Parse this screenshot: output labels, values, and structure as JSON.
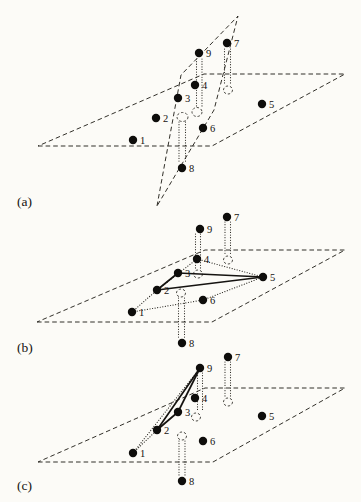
{
  "style": {
    "background": "#fcfbf7",
    "ink": "#27251f",
    "dot_color": "#0e0d0b"
  },
  "figure": {
    "subfigures": [
      {
        "key": "a",
        "label": "(a)",
        "label_x": 17,
        "label_y": 206,
        "planes": [
          {
            "name": "base-plane",
            "vertices": [
              [
                38,
                146
              ],
              [
                212,
                146
              ],
              [
                345,
                74
              ],
              [
                204,
                74
              ]
            ]
          },
          {
            "name": "transversal-plane",
            "vertices": [
              [
                157,
                206
              ],
              [
                181,
                75
              ],
              [
                238,
                16
              ],
              [
                214,
                110
              ]
            ]
          }
        ],
        "points": [
          {
            "id": "1",
            "x": 133,
            "y": 140
          },
          {
            "id": "2",
            "x": 156,
            "y": 118
          },
          {
            "id": "3",
            "x": 178,
            "y": 98
          },
          {
            "id": "4",
            "x": 195,
            "y": 85
          },
          {
            "id": "5",
            "x": 262,
            "y": 104
          },
          {
            "id": "6",
            "x": 203,
            "y": 128
          },
          {
            "id": "7",
            "x": 227,
            "y": 43
          },
          {
            "id": "8",
            "x": 182,
            "y": 168
          },
          {
            "id": "9",
            "x": 199,
            "y": 53
          }
        ],
        "solid_edges": [],
        "dotted_edges": [],
        "projections": [
          {
            "of": "9",
            "lines": [
              [
                196.5,
                59,
                196.5,
                107
              ],
              [
                202,
                59,
                202,
                107
              ]
            ],
            "ellipse": [
              197,
              112,
              5,
              4.5
            ]
          },
          {
            "of": "7",
            "lines": [
              [
                224.5,
                49,
                224.5,
                85
              ],
              [
                230.5,
                49,
                230.5,
                85
              ]
            ],
            "ellipse": [
              228,
              90,
              4.5,
              4
            ]
          },
          {
            "of": "8",
            "lines": [
              [
                179,
                122,
                179,
                163
              ],
              [
                185.5,
                122,
                185.5,
                163
              ]
            ],
            "ellipse": [
              182.5,
              117,
              5.5,
              4.5
            ]
          }
        ]
      },
      {
        "key": "b",
        "label": "(b)",
        "label_x": 17,
        "label_y": 352,
        "planes": [
          {
            "name": "base-plane",
            "vertices": [
              [
                37,
                322
              ],
              [
                212,
                322
              ],
              [
                345,
                250
              ],
              [
                205,
                250
              ]
            ]
          }
        ],
        "points": [
          {
            "id": "1",
            "x": 132,
            "y": 312
          },
          {
            "id": "2",
            "x": 157,
            "y": 290
          },
          {
            "id": "3",
            "x": 178,
            "y": 273
          },
          {
            "id": "4",
            "x": 197,
            "y": 259
          },
          {
            "id": "5",
            "x": 263,
            "y": 277
          },
          {
            "id": "6",
            "x": 203,
            "y": 300
          },
          {
            "id": "7",
            "x": 227,
            "y": 217
          },
          {
            "id": "8",
            "x": 182,
            "y": 343
          },
          {
            "id": "9",
            "x": 200,
            "y": 229
          }
        ],
        "solid_edges": [
          [
            "2",
            "3"
          ],
          [
            "3",
            "5"
          ],
          [
            "2",
            "5"
          ]
        ],
        "dotted_edges": [
          [
            "1",
            "2"
          ],
          [
            "2",
            "4"
          ],
          [
            "4",
            "5"
          ],
          [
            "1",
            "6"
          ],
          [
            "6",
            "5"
          ]
        ],
        "projections": [
          {
            "of": "9",
            "lines": [
              [
                195.5,
                234,
                195.5,
                269
              ],
              [
                200.5,
                234,
                200.5,
                269
              ]
            ],
            "ellipse": [
              198,
              274,
              4.5,
              4
            ]
          },
          {
            "of": "7",
            "lines": [
              [
                225,
                222,
                225,
                255
              ],
              [
                230.5,
                222,
                230.5,
                255
              ]
            ],
            "ellipse": [
              228,
              260,
              4.5,
              4
            ]
          },
          {
            "of": "8",
            "lines": [
              [
                178.5,
                298,
                178.5,
                338
              ],
              [
                184.5,
                298,
                184.5,
                338
              ]
            ],
            "ellipse": [
              181,
              293,
              4.5,
              4
            ]
          }
        ]
      },
      {
        "key": "c",
        "label": "(c)",
        "label_x": 17,
        "label_y": 490,
        "planes": [
          {
            "name": "base-plane",
            "vertices": [
              [
                38,
                462
              ],
              [
                213,
                462
              ],
              [
                345,
                388
              ],
              [
                205,
                388
              ]
            ]
          }
        ],
        "points": [
          {
            "id": "1",
            "x": 133,
            "y": 453
          },
          {
            "id": "2",
            "x": 157,
            "y": 430
          },
          {
            "id": "3",
            "x": 178,
            "y": 412
          },
          {
            "id": "4",
            "x": 195,
            "y": 398
          },
          {
            "id": "5",
            "x": 262,
            "y": 416
          },
          {
            "id": "6",
            "x": 203,
            "y": 441
          },
          {
            "id": "7",
            "x": 228,
            "y": 357
          },
          {
            "id": "8",
            "x": 182,
            "y": 481
          },
          {
            "id": "9",
            "x": 200,
            "y": 368
          }
        ],
        "solid_edges": [
          [
            "2",
            "3"
          ],
          [
            "3",
            "9"
          ],
          [
            "2",
            "9"
          ]
        ],
        "dotted_edges": [
          [
            "1",
            "2"
          ],
          [
            "1",
            "9"
          ]
        ],
        "projections": [
          {
            "of": "9",
            "lines": [
              [
                197.5,
                373,
                197.5,
                412
              ],
              [
                202.5,
                373,
                202.5,
                412
              ]
            ],
            "ellipse": [
              196,
              417,
              4.5,
              4
            ]
          },
          {
            "of": "7",
            "lines": [
              [
                225,
                362,
                225,
                397
              ],
              [
                230.5,
                362,
                230.5,
                397
              ]
            ],
            "ellipse": [
              228,
              402,
              4.5,
              4
            ]
          },
          {
            "of": "8",
            "lines": [
              [
                179,
                441,
                179,
                476
              ],
              [
                185,
                441,
                185,
                476
              ]
            ],
            "ellipse": [
              182,
              436,
              4.5,
              4
            ]
          }
        ]
      }
    ]
  }
}
